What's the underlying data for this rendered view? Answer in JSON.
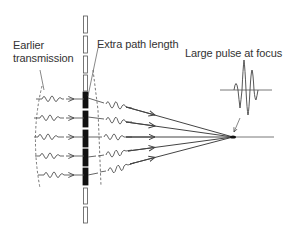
{
  "labels": {
    "earlier_line1": "Earlier",
    "earlier_line2": "transmission",
    "extra_path": "Extra path length",
    "large_pulse": "Large pulse at focus"
  },
  "colors": {
    "line": "#444444",
    "dark": "#111111",
    "wave": "#555555",
    "dashed": "#555555"
  },
  "rays": {
    "count": 5,
    "y_positions": [
      99,
      118,
      137,
      156,
      175
    ],
    "focus": {
      "x": 233,
      "y": 137
    }
  }
}
